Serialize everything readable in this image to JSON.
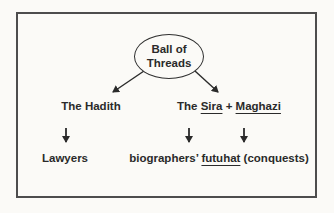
{
  "diagram": {
    "root": {
      "label_line1": "Ball of",
      "label_line2": "Threads"
    },
    "left_branch": {
      "title": "The Hadith",
      "outcome": "Lawyers"
    },
    "right_branch": {
      "title_prefix": "The ",
      "title_term1": "Sira",
      "title_connector": " + ",
      "title_term2": "Maghazi",
      "outcome_prefix": "biographers’ ",
      "outcome_term": "futuhat",
      "outcome_suffix": " (conquests)"
    },
    "icons": {
      "down_arrow": "down-arrow-icon",
      "diagonal_arrow": "diagonal-arrow-icon"
    },
    "colors": {
      "ink": "#2a2a2a",
      "frame_border": "#4d4d4d",
      "background": "#fbfaf7"
    }
  }
}
